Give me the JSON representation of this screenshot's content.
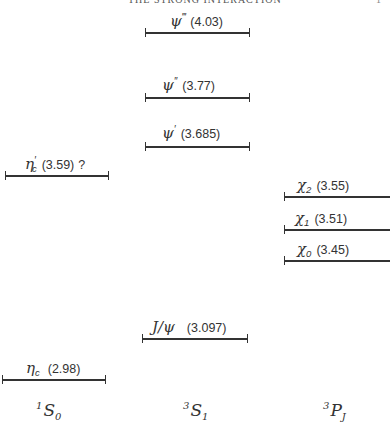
{
  "header": {
    "title": "THE STRONG INTERACTION",
    "page_number": "1"
  },
  "diagram": {
    "type": "energy-level diagram (charmonium spectrum)",
    "columns": [
      {
        "id": "1S0",
        "label_pre": "1",
        "label_main": "S",
        "label_post": "0"
      },
      {
        "id": "3S1",
        "label_pre": "3",
        "label_main": "S",
        "label_post": "1"
      },
      {
        "id": "3PJ",
        "label_pre": "3",
        "label_main": "P",
        "label_post": "J"
      }
    ],
    "levels": [
      {
        "id": "psi-triple-prime",
        "column": "3S1",
        "symbol": "ψ",
        "sup": "‴",
        "sub": "",
        "mass": "(4.03)",
        "note": ""
      },
      {
        "id": "psi-double-prime",
        "column": "3S1",
        "symbol": "ψ",
        "sup": "″",
        "sub": "",
        "mass": "(3.77)",
        "note": ""
      },
      {
        "id": "psi-prime",
        "column": "3S1",
        "symbol": "ψ",
        "sup": "′",
        "sub": "",
        "mass": "(3.685)",
        "note": ""
      },
      {
        "id": "eta-c-prime",
        "column": "1S0",
        "symbol": "η",
        "sup": "′",
        "sub": "c",
        "mass": "(3.59)",
        "note": "?"
      },
      {
        "id": "chi-2",
        "column": "3PJ",
        "symbol": "χ",
        "sup": "",
        "sub": "2",
        "mass": "(3.55)",
        "note": ""
      },
      {
        "id": "chi-1",
        "column": "3PJ",
        "symbol": "χ",
        "sup": "",
        "sub": "1",
        "mass": "(3.51)",
        "note": ""
      },
      {
        "id": "chi-0",
        "column": "3PJ",
        "symbol": "χ",
        "sup": "",
        "sub": "0",
        "mass": "(3.45)",
        "note": ""
      },
      {
        "id": "j-psi",
        "column": "3S1",
        "symbol": "J/ψ",
        "sup": "",
        "sub": "",
        "mass": "(3.097)",
        "note": ""
      },
      {
        "id": "eta-c",
        "column": "1S0",
        "symbol": "η",
        "sup": "",
        "sub": "c",
        "mass": "(2.98)",
        "note": ""
      }
    ],
    "mass_unit": "GeV"
  }
}
